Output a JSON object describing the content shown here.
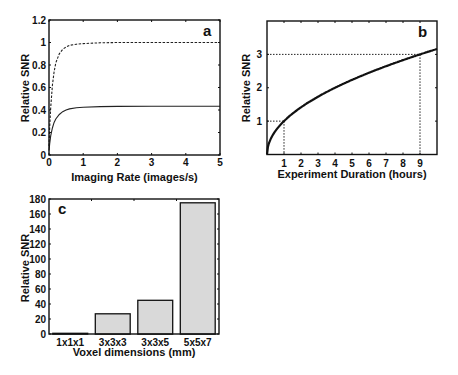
{
  "chart_data": [
    {
      "panel": "a",
      "type": "line",
      "title": "",
      "xlabel": "Imaging Rate (images/s)",
      "ylabel": "Relative SNR",
      "xlim": [
        0,
        5
      ],
      "ylim": [
        0,
        1.2
      ],
      "xticks": [
        0,
        1,
        2,
        3,
        4,
        5
      ],
      "yticks": [
        0,
        0.2,
        0.4,
        0.6,
        0.8,
        1,
        1.2
      ],
      "grid": false,
      "legend": null,
      "series": [
        {
          "name": "dashed",
          "style": "dashed",
          "x": [
            0,
            0.02,
            0.05,
            0.1,
            0.15,
            0.2,
            0.3,
            0.4,
            0.5,
            0.6,
            0.8,
            1.0,
            1.5,
            2,
            3,
            4,
            5
          ],
          "y": [
            0.08,
            0.25,
            0.42,
            0.62,
            0.74,
            0.82,
            0.9,
            0.94,
            0.96,
            0.975,
            0.985,
            0.99,
            0.997,
            1.0,
            1.0,
            1.0,
            1.0
          ]
        },
        {
          "name": "solid",
          "style": "solid",
          "x": [
            0,
            0.02,
            0.05,
            0.1,
            0.15,
            0.2,
            0.3,
            0.4,
            0.5,
            0.6,
            0.8,
            1.0,
            1.5,
            2,
            3,
            4,
            5
          ],
          "y": [
            0.04,
            0.1,
            0.17,
            0.24,
            0.29,
            0.32,
            0.36,
            0.385,
            0.4,
            0.41,
            0.42,
            0.425,
            0.43,
            0.432,
            0.433,
            0.433,
            0.433
          ]
        }
      ]
    },
    {
      "panel": "b",
      "type": "line",
      "title": "",
      "xlabel": "Experiment Duration (hours)",
      "ylabel": "Relative SNR",
      "xlim": [
        0,
        10
      ],
      "ylim": [
        0,
        4
      ],
      "xticks": [
        1,
        2,
        3,
        4,
        5,
        6,
        7,
        8,
        9
      ],
      "yticks": [
        1,
        2,
        3
      ],
      "grid": false,
      "legend": null,
      "series": [
        {
          "name": "sqrt(duration)",
          "style": "solid-thick",
          "x": [
            0,
            0.05,
            0.1,
            0.25,
            0.5,
            1,
            1.5,
            2,
            3,
            4,
            5,
            6,
            7,
            8,
            9,
            10
          ],
          "y": [
            0,
            0.22,
            0.32,
            0.5,
            0.71,
            1,
            1.22,
            1.41,
            1.73,
            2,
            2.24,
            2.45,
            2.65,
            2.83,
            3,
            3.16
          ]
        }
      ],
      "annotations": [
        {
          "type": "dotted-guide",
          "x": 1,
          "y": 1
        },
        {
          "type": "dotted-guide",
          "x": 9,
          "y": 3
        }
      ]
    },
    {
      "panel": "c",
      "type": "bar",
      "title": "",
      "xlabel": "Voxel dimensions (mm)",
      "ylabel": "Relative SNR",
      "ylim": [
        0,
        180
      ],
      "yticks": [
        0,
        20,
        40,
        60,
        80,
        100,
        120,
        140,
        160,
        180
      ],
      "grid": false,
      "legend": null,
      "categories": [
        "1x1x1",
        "3x3x3",
        "3x3x5",
        "5x5x7"
      ],
      "values": [
        1,
        27,
        45,
        175
      ],
      "bar_color": "#d9d9d9"
    }
  ],
  "panels": {
    "a": {
      "label": "a",
      "xlabel": "Imaging Rate (images/s)",
      "ylabel": "Relative SNR"
    },
    "b": {
      "label": "b",
      "xlabel": "Experiment Duration (hours)",
      "ylabel": "Relative SNR"
    },
    "c": {
      "label": "c",
      "xlabel": "Voxel dimensions (mm)",
      "ylabel": "Relative SNR"
    }
  }
}
